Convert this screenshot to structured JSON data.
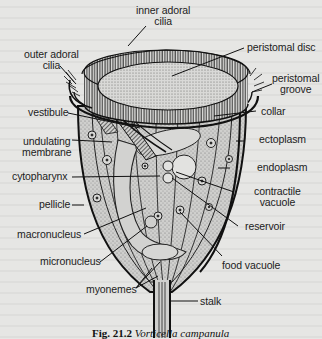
{
  "figure": {
    "subject": "Vorticella",
    "caption_number": "Fig. 21.2",
    "caption_title": "Vorticella campanula",
    "colors": {
      "background": "#e6e6e4",
      "ink": "#1a1a1a",
      "stipple": "#9a9a9a"
    }
  },
  "labels": {
    "inner_adoral_cilia": [
      "inner adoral",
      "cilia"
    ],
    "outer_adoral_cilia": [
      "outer adoral",
      "cilia"
    ],
    "peristomal_disc": "peristomal disc",
    "peristomal_groove": [
      "peristomal",
      "groove"
    ],
    "collar": "collar",
    "vestibule": "vestibule",
    "ectoplasm": "ectoplasm",
    "undulating_membrane": [
      "undulating",
      "membrane"
    ],
    "endoplasm": "endoplasm",
    "cytopharynx": "cytopharynx",
    "contractile_vacuole": [
      "contractile",
      "vacuole"
    ],
    "pellicle": "pellicle",
    "reservoir": "reservoir",
    "macronucleus": "macronucleus",
    "micronucleus": "micronucleus",
    "food_vacuole": "food vacuole",
    "myonemes": "myonemes",
    "stalk": "stalk"
  }
}
